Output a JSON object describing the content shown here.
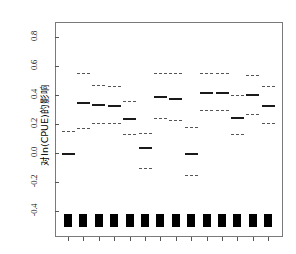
{
  "figure": {
    "background_color": "#ffffff",
    "frame_color": "#7a7a7a",
    "line_color": "#1a1a1a",
    "ci_color": "#555555",
    "rug_color": "#000000"
  },
  "axes": {
    "ylabel": "对ln(CPUE)的影响",
    "yticks": [
      "0.8",
      "0.6",
      "0.4",
      "0.2",
      "0.0",
      "-0.2",
      "-0.4"
    ],
    "ytick_values": [
      0.8,
      0.6,
      0.4,
      0.2,
      0.0,
      -0.2,
      -0.4
    ],
    "ylim": [
      -0.52,
      0.92
    ],
    "xlabel": "",
    "xticks": [],
    "grid": false,
    "legend": false
  },
  "chart_data": {
    "type": "scatter",
    "title": "",
    "xlabel": "",
    "ylabel": "对ln(CPUE)的影响",
    "ylim": [
      -0.52,
      0.92
    ],
    "categories": [
      "1",
      "2",
      "3",
      "4",
      "5",
      "6",
      "7",
      "8",
      "9",
      "10",
      "11",
      "12",
      "13",
      "14"
    ],
    "series": [
      {
        "name": "估计值",
        "values": [
          0.0,
          0.35,
          0.34,
          0.33,
          0.24,
          0.04,
          0.39,
          0.38,
          0.0,
          0.42,
          0.42,
          0.25,
          0.41,
          0.33
        ]
      },
      {
        "name": "置信上限",
        "values": [
          0.15,
          0.55,
          0.47,
          0.46,
          0.36,
          0.14,
          0.55,
          0.55,
          0.18,
          0.55,
          0.55,
          0.4,
          0.54,
          0.46
        ]
      },
      {
        "name": "置信下限",
        "values": [
          0.0,
          0.17,
          0.21,
          0.21,
          0.13,
          -0.1,
          0.24,
          0.23,
          -0.15,
          0.3,
          0.3,
          0.13,
          0.27,
          0.21
        ]
      }
    ],
    "rug_marks": {
      "count": 14,
      "y": -0.46,
      "description": "黑色矩形标记"
    }
  }
}
